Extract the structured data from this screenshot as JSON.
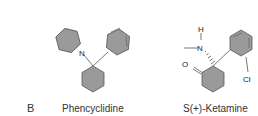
{
  "panel_label": "B",
  "molecules": [
    {
      "name": "Phencyclidine",
      "atoms": [
        "N"
      ]
    },
    {
      "name": "S(+)-Ketamine",
      "atoms": [
        "H",
        "N",
        "O",
        "Cl"
      ]
    }
  ],
  "colors": {
    "ring_fill": "#9a9a9a",
    "stroke": "#555555",
    "text": "#333333"
  }
}
